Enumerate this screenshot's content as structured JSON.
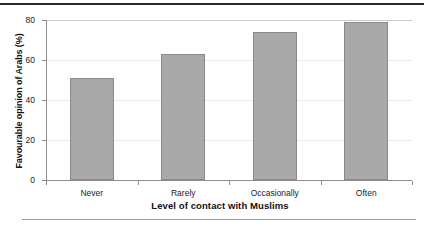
{
  "chart_data": {
    "type": "bar",
    "title": "",
    "categories": [
      "Never",
      "Rarely",
      "Occasionally",
      "Often"
    ],
    "values": [
      51,
      63,
      74,
      79
    ],
    "xlabel": "Level of contact with Muslims",
    "ylabel": "Favourable opinion of Arabs (%)",
    "ylim": [
      0,
      80
    ],
    "yticks": [
      0,
      20,
      40,
      60,
      80
    ],
    "ytick_labels": [
      "0",
      "20",
      "40",
      "60",
      "80"
    ],
    "grid": "horizontal",
    "legend": "none",
    "series": [
      {
        "name": "Favourable opinion of Arabs (%)",
        "values": [
          51,
          63,
          74,
          79
        ]
      }
    ],
    "colors": {
      "bar_fill": "#a9a9a9",
      "bar_edge": "#8a8a8a",
      "gridline": "#e9e9e9",
      "axis": "#8d8d8d",
      "text": "#222222",
      "rule_top": "#2b2b2b",
      "rule_bottom": "#9a9a9a"
    }
  }
}
